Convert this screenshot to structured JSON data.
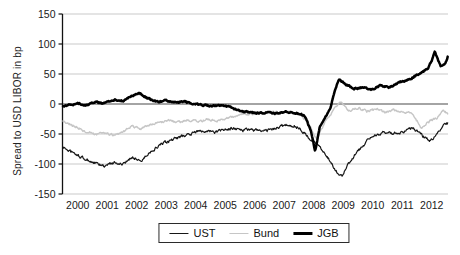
{
  "chart_data": {
    "type": "line",
    "title": "",
    "xlabel": "",
    "ylabel": "Spread to USD LIBOR in bp",
    "ylim": [
      -150,
      150
    ],
    "xlim": [
      2000,
      2013.05
    ],
    "yticks": [
      150,
      100,
      50,
      0,
      -50,
      -100,
      -150
    ],
    "xticks": [
      2000,
      2001,
      2002,
      2003,
      2004,
      2005,
      2006,
      2007,
      2008,
      2009,
      2010,
      2011,
      2012
    ],
    "grid": "horizontal",
    "zero_line": true,
    "legend_position": "bottom-center",
    "colors": {
      "ust": "#161616",
      "bund": "#c6c6c6",
      "jgb": "#000000",
      "grid": "#c9c9c9",
      "zero_axis": "#4a4a4a",
      "axis": "#111111"
    },
    "series": [
      {
        "name": "UST",
        "color": "#161616",
        "stroke_width": 1.2,
        "noise_bp": 4.5,
        "x": [
          2000.0,
          2000.5,
          2000.8,
          2001.1,
          2001.4,
          2001.75,
          2002.05,
          2002.35,
          2002.65,
          2003.0,
          2003.3,
          2003.6,
          2003.9,
          2004.25,
          2004.55,
          2004.85,
          2005.15,
          2005.5,
          2005.8,
          2006.1,
          2006.4,
          2006.75,
          2007.05,
          2007.35,
          2007.65,
          2008.0,
          2008.3,
          2008.6,
          2008.9,
          2009.25,
          2009.45,
          2009.65,
          2009.95,
          2010.3,
          2010.6,
          2010.9,
          2011.2,
          2011.55,
          2011.85,
          2012.15,
          2012.45,
          2012.7,
          2012.9,
          2013.05
        ],
        "values": [
          -72,
          -86,
          -93,
          -99,
          -104,
          -97,
          -101,
          -88,
          -95,
          -78,
          -68,
          -62,
          -56,
          -51,
          -46,
          -44,
          -47,
          -43,
          -40,
          -44,
          -42,
          -46,
          -43,
          -38,
          -34,
          -40,
          -54,
          -66,
          -82,
          -112,
          -120,
          -100,
          -82,
          -62,
          -52,
          -46,
          -50,
          -45,
          -40,
          -52,
          -62,
          -48,
          -36,
          -32
        ]
      },
      {
        "name": "Bund",
        "color": "#c6c6c6",
        "stroke_width": 1.4,
        "noise_bp": 3.5,
        "x": [
          2000.0,
          2000.5,
          2000.8,
          2001.1,
          2001.4,
          2001.75,
          2002.05,
          2002.35,
          2002.65,
          2003.0,
          2003.3,
          2003.6,
          2003.9,
          2004.25,
          2004.55,
          2004.85,
          2005.15,
          2005.5,
          2005.8,
          2006.1,
          2006.4,
          2006.75,
          2007.05,
          2007.35,
          2007.65,
          2008.0,
          2008.3,
          2008.6,
          2008.9,
          2009.25,
          2009.45,
          2009.65,
          2009.95,
          2010.3,
          2010.6,
          2010.9,
          2011.2,
          2011.55,
          2011.85,
          2012.15,
          2012.45,
          2012.7,
          2012.9,
          2013.05
        ],
        "values": [
          -28,
          -40,
          -46,
          -51,
          -49,
          -52,
          -46,
          -38,
          -41,
          -34,
          -30,
          -28,
          -31,
          -27,
          -29,
          -26,
          -28,
          -24,
          -21,
          -18,
          -16,
          -15,
          -14,
          -13,
          -12,
          -16,
          -30,
          -60,
          -28,
          -5,
          5,
          -12,
          -6,
          -12,
          -8,
          -14,
          -10,
          -13,
          -16,
          -40,
          -28,
          -22,
          -10,
          -16
        ]
      },
      {
        "name": "JGB",
        "color": "#000000",
        "stroke_width": 2.5,
        "noise_bp": 2.5,
        "x": [
          2000.0,
          2000.5,
          2000.8,
          2001.1,
          2001.4,
          2001.75,
          2002.05,
          2002.25,
          2002.55,
          2002.9,
          2003.2,
          2003.5,
          2003.8,
          2004.15,
          2004.45,
          2004.75,
          2005.05,
          2005.4,
          2005.7,
          2006.0,
          2006.3,
          2006.65,
          2006.95,
          2007.25,
          2007.55,
          2007.9,
          2008.2,
          2008.4,
          2008.55,
          2008.7,
          2008.9,
          2009.05,
          2009.2,
          2009.35,
          2009.55,
          2009.85,
          2010.15,
          2010.45,
          2010.75,
          2011.1,
          2011.4,
          2011.7,
          2012.05,
          2012.35,
          2012.5,
          2012.6,
          2012.8,
          2012.95,
          2013.05
        ],
        "values": [
          -3,
          1,
          -2,
          3,
          1,
          7,
          5,
          12,
          19,
          9,
          4,
          6,
          3,
          4,
          0,
          -2,
          -3,
          -2,
          -6,
          -12,
          -14,
          -15,
          -14,
          -16,
          -13,
          -15,
          -20,
          -45,
          -78,
          -38,
          -20,
          -8,
          18,
          42,
          34,
          26,
          28,
          24,
          30,
          28,
          36,
          40,
          50,
          58,
          72,
          88,
          62,
          66,
          80
        ]
      }
    ]
  }
}
